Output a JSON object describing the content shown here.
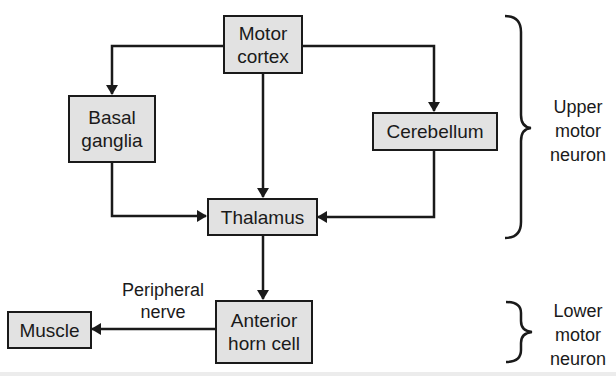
{
  "diagram": {
    "type": "flowchart",
    "colors": {
      "box_fill": "#e2e2e2",
      "stroke": "#1a1a1a",
      "background": "#ffffff"
    },
    "nodes": {
      "motor_cortex": "Motor\ncortex",
      "basal_ganglia": "Basal\nganglia",
      "cerebellum": "Cerebellum",
      "thalamus": "Thalamus",
      "anterior_horn_cell": "Anterior\nhorn cell",
      "muscle": "Muscle"
    },
    "edge_labels": {
      "peripheral_nerve": "Peripheral\nnerve"
    },
    "groups": {
      "upper": "Upper\nmotor\nneuron",
      "lower": "Lower\nmotor\nneuron"
    },
    "edges": [
      {
        "from": "Motor cortex",
        "to": "Basal ganglia"
      },
      {
        "from": "Motor cortex",
        "to": "Thalamus"
      },
      {
        "from": "Motor cortex",
        "to": "Cerebellum"
      },
      {
        "from": "Basal ganglia",
        "to": "Thalamus"
      },
      {
        "from": "Cerebellum",
        "to": "Thalamus"
      },
      {
        "from": "Thalamus",
        "to": "Anterior horn cell"
      },
      {
        "from": "Anterior horn cell",
        "to": "Muscle",
        "label": "Peripheral nerve"
      }
    ]
  }
}
